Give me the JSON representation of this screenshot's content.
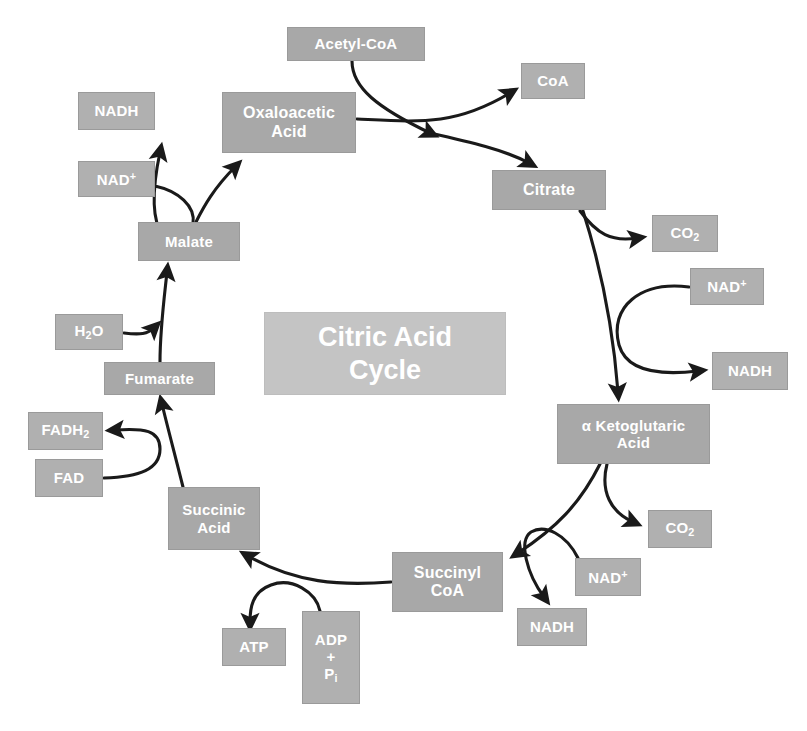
{
  "diagram": {
    "title": "Citric Acid Cycle",
    "title_lines": [
      "Citric Acid",
      "Cycle"
    ],
    "colors": {
      "node_fill": "#a6a6a6",
      "title_fill": "#c4c4c4",
      "node_text": "#ffffff",
      "arrow": "#1a1a1a",
      "background": "#ffffff"
    }
  },
  "nodes": {
    "acetyl_coa": {
      "label": "Acetyl-CoA",
      "x": 287,
      "y": 27,
      "w": 138,
      "h": 34,
      "font": 15
    },
    "coa": {
      "label": "CoA",
      "x": 521,
      "y": 63,
      "w": 64,
      "h": 36,
      "font": 15
    },
    "oxaloacetic_acid": {
      "line1": "Oxaloacetic",
      "line2": "Acid",
      "x": 222,
      "y": 92,
      "w": 134,
      "h": 61,
      "font": 16
    },
    "citrate": {
      "label": "Citrate",
      "x": 492,
      "y": 170,
      "w": 114,
      "h": 40,
      "font": 16
    },
    "nadh_top_left": {
      "label": "NADH",
      "x": 78,
      "y": 92,
      "w": 77,
      "h": 38,
      "font": 15
    },
    "nad_plus_top_left": {
      "base": "NAD",
      "charge": "+",
      "x": 78,
      "y": 161,
      "w": 77,
      "h": 36,
      "font": 15
    },
    "co2_upper_right": {
      "base": "CO",
      "sub": "2",
      "x": 652,
      "y": 215,
      "w": 66,
      "h": 37,
      "font": 15
    },
    "nad_plus_right": {
      "base": "NAD",
      "charge": "+",
      "x": 690,
      "y": 268,
      "w": 74,
      "h": 37,
      "font": 15
    },
    "nadh_right": {
      "label": "NADH",
      "x": 712,
      "y": 352,
      "w": 76,
      "h": 38,
      "font": 15
    },
    "alpha_ketoglutaric_acid": {
      "line1": "α Ketoglutaric",
      "line2": "Acid",
      "x": 557,
      "y": 404,
      "w": 153,
      "h": 60,
      "font": 15
    },
    "malate": {
      "label": "Malate",
      "x": 138,
      "y": 222,
      "w": 102,
      "h": 39,
      "font": 15
    },
    "h2o": {
      "base": "H",
      "sub": "2",
      "tail": "O",
      "x": 55,
      "y": 314,
      "w": 68,
      "h": 36,
      "font": 15
    },
    "fumarate": {
      "label": "Fumarate",
      "x": 104,
      "y": 362,
      "w": 111,
      "h": 33,
      "font": 15
    },
    "fadh2": {
      "base": "FADH",
      "sub": "2",
      "x": 28,
      "y": 412,
      "w": 75,
      "h": 38,
      "font": 15
    },
    "fad": {
      "label": "FAD",
      "x": 35,
      "y": 459,
      "w": 68,
      "h": 38,
      "font": 15
    },
    "succinic_acid": {
      "line1": "Succinic",
      "line2": "Acid",
      "x": 168,
      "y": 487,
      "w": 92,
      "h": 63,
      "font": 15
    },
    "succinyl_coa": {
      "line1": "Succinyl",
      "line2": "CoA",
      "x": 392,
      "y": 552,
      "w": 111,
      "h": 60,
      "font": 16
    },
    "co2_lower_right": {
      "base": "CO",
      "sub": "2",
      "x": 648,
      "y": 510,
      "w": 64,
      "h": 38,
      "font": 15
    },
    "nad_plus_lower": {
      "base": "NAD",
      "charge": "+",
      "x": 575,
      "y": 558,
      "w": 66,
      "h": 38,
      "font": 15
    },
    "nadh_lower": {
      "label": "NADH",
      "x": 517,
      "y": 608,
      "w": 70,
      "h": 38,
      "font": 15
    },
    "atp": {
      "label": "ATP",
      "x": 222,
      "y": 628,
      "w": 64,
      "h": 38,
      "font": 15
    },
    "adp_pi": {
      "line1": "ADP",
      "line2": "+",
      "line3": "P",
      "line3_sub": "i",
      "x": 302,
      "y": 611,
      "w": 58,
      "h": 93,
      "font": 15
    }
  },
  "title_box": {
    "x": 264,
    "y": 312,
    "w": 242,
    "h": 83
  },
  "arrows": [
    {
      "name": "acetyl-coa-to-cycle",
      "from": "acetyl_coa",
      "to": "junction-top"
    },
    {
      "name": "oxaloacetic-to-coa",
      "from": "oxaloacetic_acid",
      "to": "coa"
    },
    {
      "name": "oxaloacetic-to-citrate",
      "from": "oxaloacetic_acid",
      "to": "citrate"
    },
    {
      "name": "citrate-to-co2",
      "from": "citrate",
      "to": "co2_upper_right"
    },
    {
      "name": "citrate-to-alpha-ketoglutaric",
      "from": "citrate",
      "to": "alpha_ketoglutaric_acid"
    },
    {
      "name": "nad-plus-to-nadh-right",
      "from": "nad_plus_right",
      "to": "nadh_right"
    },
    {
      "name": "alpha-ketoglutaric-to-co2",
      "from": "alpha_ketoglutaric_acid",
      "to": "co2_lower_right"
    },
    {
      "name": "alpha-ketoglutaric-to-succinyl-coa",
      "from": "alpha_ketoglutaric_acid",
      "to": "succinyl_coa"
    },
    {
      "name": "nad-plus-to-nadh-lower",
      "from": "nad_plus_lower",
      "to": "nadh_lower"
    },
    {
      "name": "succinyl-coa-to-succinic-acid",
      "from": "succinyl_coa",
      "to": "succinic_acid"
    },
    {
      "name": "adp-pi-to-atp",
      "from": "adp_pi",
      "to": "atp"
    },
    {
      "name": "succinic-acid-to-fumarate",
      "from": "succinic_acid",
      "to": "fumarate"
    },
    {
      "name": "fad-to-fadh2",
      "from": "fad",
      "to": "fadh2"
    },
    {
      "name": "fumarate-to-malate",
      "from": "fumarate",
      "to": "malate"
    },
    {
      "name": "h2o-to-malate",
      "from": "h2o",
      "to": "malate"
    },
    {
      "name": "malate-to-oxaloacetic",
      "from": "malate",
      "to": "oxaloacetic_acid"
    },
    {
      "name": "nad-plus-to-nadh-top-left",
      "from": "nad_plus_top_left",
      "to": "nadh_top_left"
    }
  ]
}
